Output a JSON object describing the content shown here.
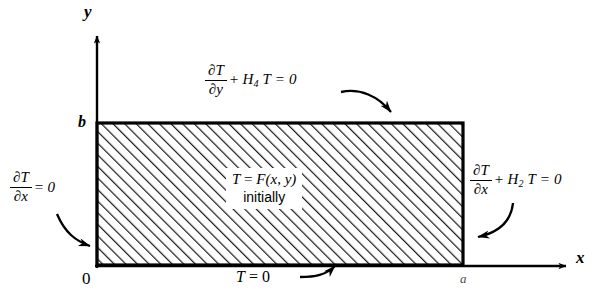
{
  "figure": {
    "background_color": "#ffffff",
    "line_color": "#000000",
    "hatch_color": "#000000"
  },
  "axes": {
    "y_label": "y",
    "x_label": "x",
    "origin_label": "0",
    "y_tick_label": "b",
    "x_tick_label": "a"
  },
  "domain": {
    "x_from": 0,
    "x_to": "a",
    "y_from": 0,
    "y_to": "b",
    "fill": "hatched"
  },
  "boundary_conditions": {
    "top": {
      "name": "top-boundary-condition",
      "numerator": "∂T",
      "denominator": "∂y",
      "remainder_op": "+",
      "remainder_coefficient": "H",
      "remainder_subscript": "4",
      "remainder_tail": "T = 0",
      "full_text": "∂T/∂y + H₄T = 0"
    },
    "right": {
      "name": "right-boundary-condition",
      "numerator": "∂T",
      "denominator": "∂x",
      "remainder_op": "+",
      "remainder_coefficient": "H",
      "remainder_subscript": "2",
      "remainder_tail": "T = 0",
      "full_text": "∂T/∂x + H₂T = 0"
    },
    "left": {
      "name": "left-boundary-condition",
      "numerator": "∂T",
      "denominator": "∂x",
      "remainder_op": "=",
      "remainder_tail": "0",
      "full_text": "∂T/∂x = 0"
    },
    "bottom": {
      "name": "bottom-boundary-condition",
      "variable": "T",
      "op": " = ",
      "value": "0",
      "full_text": "T = 0"
    }
  },
  "initial_condition": {
    "line1_variable": "T",
    "line1_op": " = ",
    "line1_function": "F(x, y)",
    "line1_text": "T = F(x, y)",
    "line2_text": "initially"
  }
}
